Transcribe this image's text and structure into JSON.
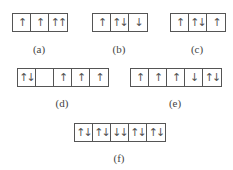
{
  "diagrams": [
    {
      "id": "a",
      "label": "(a)",
      "cells": [
        "↑",
        "↑",
        "↑↑"
      ]
    },
    {
      "id": "b",
      "label": "(b)",
      "cells": [
        "↑",
        "↑↓",
        "↓"
      ]
    },
    {
      "id": "c",
      "label": "(c)",
      "cells": [
        "↑",
        "↑↓",
        "↑"
      ]
    },
    {
      "id": "d",
      "label": "(d)",
      "cells": [
        "↑↓",
        "",
        "↑",
        "↑",
        "↑"
      ]
    },
    {
      "id": "e",
      "label": "(e)",
      "cells": [
        "↑",
        "↑",
        "↑",
        "↓",
        "↑↓"
      ]
    },
    {
      "id": "f",
      "label": "(f)",
      "cells": [
        "↑↓",
        "↑↓",
        "↓↓",
        "↑↓",
        "↑↓"
      ]
    }
  ]
}
